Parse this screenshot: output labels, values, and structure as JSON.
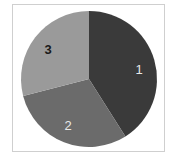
{
  "chart_data": {
    "type": "pie",
    "title": "",
    "categories": [
      "1",
      "2",
      "3"
    ],
    "values": [
      41,
      30,
      29
    ],
    "colors": [
      "#3a3a3a",
      "#6b6b6b",
      "#9a9a9a"
    ],
    "label_colors": [
      "#e8e8e8",
      "#e8e8e8",
      "#1a1a1a"
    ],
    "start_angle_deg": 0,
    "direction": "clockwise",
    "legend": "none",
    "frame_border_color": "#cfcfcf"
  },
  "labels": {
    "slice_1": "1",
    "slice_2": "2",
    "slice_3": "3"
  }
}
